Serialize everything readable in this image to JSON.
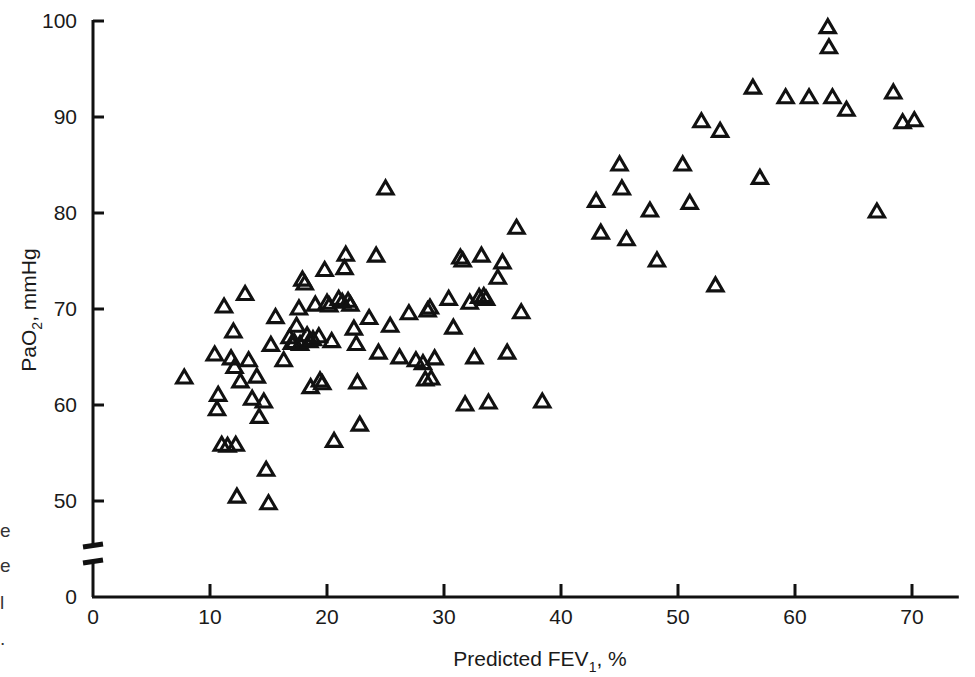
{
  "figure": {
    "marker": "open-triangle",
    "marker_color": "#111111",
    "background": "#ffffff",
    "axis_color": "#111111"
  },
  "chart_data": {
    "type": "scatter",
    "title": "",
    "xlabel_main": "Predicted FEV",
    "xlabel_sub": "1",
    "xlabel_tail": ", %",
    "ylabel_main": "PaO",
    "ylabel_sub": "2",
    "ylabel_tail": ", mmHg",
    "xlim": [
      0,
      74
    ],
    "ylim": [
      0,
      100
    ],
    "y_axis_break": true,
    "y_break_between": [
      0,
      47
    ],
    "grid": false,
    "legend": null,
    "xticks": [
      0,
      10,
      20,
      30,
      40,
      50,
      60,
      70
    ],
    "xtick_labels": [
      "0",
      "10",
      "20",
      "30",
      "40",
      "50",
      "60",
      "70"
    ],
    "yticks": [
      0,
      50,
      60,
      70,
      80,
      90,
      100
    ],
    "ytick_labels": [
      "0",
      "50",
      "60",
      "70",
      "80",
      "90",
      "100"
    ],
    "series_name": "patients",
    "n_points": 118,
    "points": [
      [
        7.8,
        62.8
      ],
      [
        10.4,
        65.2
      ],
      [
        10.6,
        59.5
      ],
      [
        10.7,
        61.0
      ],
      [
        11.0,
        55.8
      ],
      [
        11.5,
        55.7
      ],
      [
        11.2,
        70.2
      ],
      [
        11.8,
        64.8
      ],
      [
        12.0,
        67.6
      ],
      [
        12.1,
        63.9
      ],
      [
        12.2,
        55.8
      ],
      [
        12.3,
        50.4
      ],
      [
        12.6,
        62.4
      ],
      [
        13.0,
        71.5
      ],
      [
        13.3,
        64.6
      ],
      [
        13.6,
        60.6
      ],
      [
        14.0,
        62.9
      ],
      [
        14.2,
        58.7
      ],
      [
        14.6,
        60.3
      ],
      [
        14.8,
        53.2
      ],
      [
        15.0,
        49.7
      ],
      [
        15.2,
        66.2
      ],
      [
        15.6,
        69.1
      ],
      [
        16.3,
        64.6
      ],
      [
        16.8,
        67.0
      ],
      [
        17.0,
        66.4
      ],
      [
        17.2,
        66.5
      ],
      [
        17.4,
        68.2
      ],
      [
        17.6,
        70.0
      ],
      [
        17.7,
        66.3
      ],
      [
        17.9,
        73.0
      ],
      [
        18.1,
        72.6
      ],
      [
        18.3,
        67.2
      ],
      [
        18.5,
        66.6
      ],
      [
        18.6,
        61.8
      ],
      [
        18.8,
        66.8
      ],
      [
        19.0,
        70.4
      ],
      [
        19.3,
        67.1
      ],
      [
        19.4,
        62.5
      ],
      [
        19.6,
        62.2
      ],
      [
        19.8,
        74.0
      ],
      [
        20.0,
        70.6
      ],
      [
        20.2,
        70.3
      ],
      [
        20.4,
        66.6
      ],
      [
        20.6,
        56.2
      ],
      [
        21.0,
        71.0
      ],
      [
        21.3,
        70.7
      ],
      [
        21.5,
        74.2
      ],
      [
        21.6,
        75.6
      ],
      [
        21.8,
        70.8
      ],
      [
        22.0,
        70.4
      ],
      [
        22.3,
        67.9
      ],
      [
        22.5,
        66.3
      ],
      [
        22.6,
        62.3
      ],
      [
        22.8,
        57.9
      ],
      [
        23.6,
        69.0
      ],
      [
        24.2,
        75.5
      ],
      [
        24.4,
        65.4
      ],
      [
        25.0,
        82.5
      ],
      [
        25.4,
        68.2
      ],
      [
        26.2,
        64.9
      ],
      [
        27.0,
        69.5
      ],
      [
        27.6,
        64.6
      ],
      [
        28.2,
        64.3
      ],
      [
        28.4,
        62.6
      ],
      [
        28.6,
        69.8
      ],
      [
        28.8,
        70.1
      ],
      [
        28.9,
        62.7
      ],
      [
        29.2,
        64.8
      ],
      [
        30.4,
        71.0
      ],
      [
        30.8,
        68.0
      ],
      [
        31.4,
        75.3
      ],
      [
        31.6,
        75.0
      ],
      [
        31.8,
        60.0
      ],
      [
        32.2,
        70.6
      ],
      [
        32.6,
        64.9
      ],
      [
        33.0,
        71.2
      ],
      [
        33.2,
        75.5
      ],
      [
        33.4,
        71.3
      ],
      [
        33.6,
        71.0
      ],
      [
        33.8,
        60.2
      ],
      [
        34.6,
        73.2
      ],
      [
        35.0,
        74.8
      ],
      [
        35.4,
        65.4
      ],
      [
        36.2,
        78.4
      ],
      [
        36.6,
        69.6
      ],
      [
        38.4,
        60.3
      ],
      [
        43.0,
        81.2
      ],
      [
        43.4,
        77.9
      ],
      [
        45.0,
        85.0
      ],
      [
        45.2,
        82.5
      ],
      [
        45.6,
        77.2
      ],
      [
        47.6,
        80.2
      ],
      [
        48.2,
        75.0
      ],
      [
        50.4,
        85.0
      ],
      [
        51.0,
        81.0
      ],
      [
        53.2,
        72.4
      ],
      [
        53.6,
        88.5
      ],
      [
        52.0,
        89.5
      ],
      [
        56.4,
        93.0
      ],
      [
        57.0,
        83.6
      ],
      [
        59.2,
        92.0
      ],
      [
        61.2,
        92.0
      ],
      [
        62.8,
        99.3
      ],
      [
        62.9,
        97.2
      ],
      [
        63.2,
        92.0
      ],
      [
        64.4,
        90.7
      ],
      [
        67.0,
        80.1
      ],
      [
        68.4,
        92.5
      ],
      [
        69.2,
        89.4
      ],
      [
        70.2,
        89.6
      ]
    ]
  }
}
